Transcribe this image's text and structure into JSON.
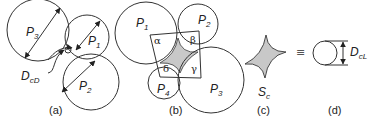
{
  "panels": {
    "a": {
      "caption": "(a)",
      "labels": {
        "p3": "P",
        "p3_sub": "3",
        "p1": "P",
        "p1_sub": "1",
        "p2": "P",
        "p2_sub": "2",
        "dcd": "D",
        "dcd_sub": "cD"
      }
    },
    "b": {
      "caption": "(b)",
      "labels": {
        "p1": "P",
        "p1_sub": "1",
        "p2": "P",
        "p2_sub": "2",
        "p3": "P",
        "p3_sub": "3",
        "p4": "P",
        "p4_sub": "4",
        "alpha": "α",
        "beta": "β",
        "gamma": "γ",
        "delta": "δ"
      }
    },
    "c": {
      "caption": "(c)",
      "label": "S",
      "label_sub": "c"
    },
    "equiv_symbol": "≡",
    "d": {
      "caption": "(d)",
      "label": "D",
      "label_sub": "cL"
    }
  },
  "colors": {
    "line": "#333333",
    "shade": "#c8c8c8"
  }
}
